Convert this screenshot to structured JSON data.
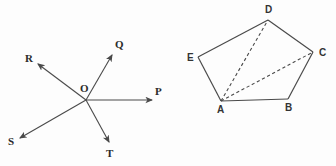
{
  "page": {
    "width": 336,
    "height": 166,
    "background_color": "#fdfdfd",
    "stroke_color": "#4a4a4a",
    "label_color": "#2b2b2b"
  },
  "figures": [
    {
      "id": "ray-diagram",
      "name": "concurrent-rays-from-point-O",
      "description": "Five rays emanating from a common origin point labeled O",
      "origin": {
        "label": "O",
        "x": 86,
        "y": 100,
        "label_x": 80,
        "label_y": 92
      },
      "rays": [
        {
          "label": "P",
          "from_x": 86,
          "from_y": 100,
          "to_x": 152,
          "to_y": 100,
          "label_x": 155,
          "label_y": 95,
          "arrow": true,
          "direction": "east"
        },
        {
          "label": "Q",
          "from_x": 86,
          "from_y": 100,
          "to_x": 112,
          "to_y": 55,
          "label_x": 115,
          "label_y": 48,
          "arrow": true,
          "direction": "northeast"
        },
        {
          "label": "R",
          "from_x": 86,
          "from_y": 100,
          "to_x": 38,
          "to_y": 64,
          "label_x": 25,
          "label_y": 62,
          "arrow": true,
          "direction": "northwest"
        },
        {
          "label": "S",
          "from_x": 86,
          "from_y": 100,
          "to_x": 20,
          "to_y": 138,
          "label_x": 8,
          "label_y": 145,
          "arrow": true,
          "direction": "southwest"
        },
        {
          "label": "T",
          "from_x": 86,
          "from_y": 100,
          "to_x": 109,
          "to_y": 142,
          "label_x": 106,
          "label_y": 157,
          "arrow": true,
          "direction": "southeast"
        }
      ]
    },
    {
      "id": "pentagon-diagram",
      "name": "pentagon-abcde-with-diagonals",
      "description": "Irregular pentagon ABCDE with two dashed diagonals drawn from vertex A",
      "vertices": [
        {
          "label": "A",
          "x": 53,
          "y": 101,
          "label_x": 49,
          "label_y": 113
        },
        {
          "label": "B",
          "x": 120,
          "y": 99,
          "label_x": 117,
          "label_y": 111
        },
        {
          "label": "C",
          "x": 145,
          "y": 52,
          "label_x": 151,
          "label_y": 56
        },
        {
          "label": "D",
          "x": 100,
          "y": 20,
          "label_x": 97,
          "label_y": 13
        },
        {
          "label": "E",
          "x": 30,
          "y": 57,
          "label_x": 19,
          "label_y": 61
        }
      ],
      "edges": [
        {
          "from": "A",
          "to": "B",
          "style": "solid"
        },
        {
          "from": "B",
          "to": "C",
          "style": "solid"
        },
        {
          "from": "C",
          "to": "D",
          "style": "solid"
        },
        {
          "from": "D",
          "to": "E",
          "style": "solid"
        },
        {
          "from": "E",
          "to": "A",
          "style": "solid"
        }
      ],
      "diagonals": [
        {
          "from": "A",
          "to": "C",
          "style": "dashed"
        },
        {
          "from": "A",
          "to": "D",
          "style": "dashed"
        }
      ]
    }
  ]
}
